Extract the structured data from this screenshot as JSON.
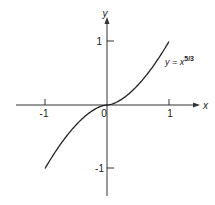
{
  "chart_data": {
    "type": "line",
    "title": "",
    "function_label": "y = x^(5/3)",
    "label_main": "y = x",
    "label_exponent": "5/3",
    "xlabel": "x",
    "ylabel": "y",
    "x_ticks": [
      "-1",
      "0",
      "1"
    ],
    "y_ticks": [
      "1",
      "-1"
    ],
    "origin_label": "0",
    "xlim": [
      -1.5,
      1.2
    ],
    "ylim": [
      -1.4,
      1.5
    ],
    "grid": false,
    "series": [
      {
        "name": "y = x^(5/3)",
        "x": [
          -1,
          -0.75,
          -0.5,
          -0.25,
          0,
          0.25,
          0.5,
          0.75,
          1
        ],
        "values": [
          -1,
          -0.619,
          -0.315,
          -0.099,
          0,
          0.099,
          0.315,
          0.619,
          1
        ]
      }
    ]
  },
  "colors": {
    "curve": "#222222",
    "axis": "#222222"
  }
}
